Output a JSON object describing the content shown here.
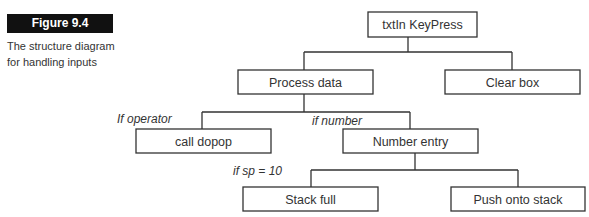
{
  "figure": {
    "label": "Figure 9.4",
    "caption_line1": "The structure diagram",
    "caption_line2": "for handling inputs"
  },
  "diagram": {
    "nodes": {
      "root": "txtIn KeyPress",
      "process": "Process data",
      "clear": "Clear box",
      "dopop": "call dopop",
      "number": "Number entry",
      "stackfull": "Stack full",
      "push": "Push onto stack"
    },
    "conditions": {
      "operator": "If operator",
      "number": "if number",
      "sp": "if sp = 10"
    },
    "edges": [
      [
        "root",
        "process"
      ],
      [
        "root",
        "clear"
      ],
      [
        "process",
        "dopop"
      ],
      [
        "process",
        "number"
      ],
      [
        "number",
        "stackfull"
      ],
      [
        "number",
        "push"
      ]
    ]
  }
}
